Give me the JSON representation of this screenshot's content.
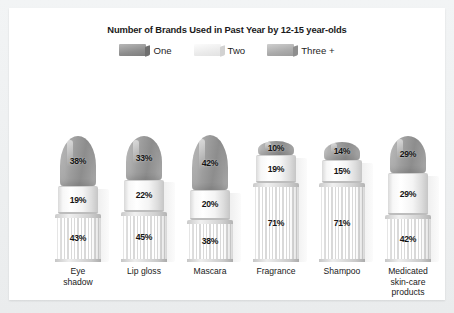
{
  "chart_data": {
    "type": "bar",
    "title": "Number of Brands Used in Past Year by 12-15 year-olds",
    "subtitle": "",
    "xlabel": "",
    "ylabel": "",
    "stacked": true,
    "units": "percent",
    "grid": false,
    "legend_position": "top",
    "legend": [
      "One",
      "Two",
      "Three +"
    ],
    "categories": [
      "Eye shadow",
      "Lip gloss",
      "Mascara",
      "Fragrance",
      "Shampoo",
      "Medicated skin-care products"
    ],
    "series": [
      {
        "name": "One",
        "values": [
          43,
          45,
          38,
          71,
          71,
          42
        ]
      },
      {
        "name": "Two",
        "values": [
          19,
          22,
          20,
          19,
          15,
          29
        ]
      },
      {
        "name": "Three +",
        "values": [
          38,
          33,
          42,
          10,
          14,
          29
        ]
      }
    ],
    "colors": {
      "one": "#8e8e8e",
      "two": "#f2f2f2",
      "three_plus": "#a9a9a9"
    }
  },
  "chart": {
    "title": "Number of Brands Used in Past Year by 12-15 year-olds",
    "legend": [
      {
        "label": "One",
        "swatch": "swatch-one"
      },
      {
        "label": "Two",
        "swatch": "swatch-two"
      },
      {
        "label": "Three +",
        "swatch": "swatch-three-plus"
      }
    ],
    "columns": [
      {
        "label_lines": [
          "Eye",
          "shadow"
        ],
        "tip_pct": "38%",
        "collar_pct": "19%",
        "barrel_pct": "43%",
        "tip_value": 38,
        "collar_value": 19,
        "barrel_value": 43
      },
      {
        "label_lines": [
          "Lip gloss"
        ],
        "tip_pct": "33%",
        "collar_pct": "22%",
        "barrel_pct": "45%",
        "tip_value": 33,
        "collar_value": 22,
        "barrel_value": 45
      },
      {
        "label_lines": [
          "Mascara"
        ],
        "tip_pct": "42%",
        "collar_pct": "20%",
        "barrel_pct": "38%",
        "tip_value": 42,
        "collar_value": 20,
        "barrel_value": 38
      },
      {
        "label_lines": [
          "Fragrance"
        ],
        "tip_pct": "10%",
        "collar_pct": "19%",
        "barrel_pct": "71%",
        "tip_value": 10,
        "collar_value": 19,
        "barrel_value": 71
      },
      {
        "label_lines": [
          "Shampoo"
        ],
        "tip_pct": "14%",
        "collar_pct": "15%",
        "barrel_pct": "71%",
        "tip_value": 14,
        "collar_value": 15,
        "barrel_value": 71
      },
      {
        "label_lines": [
          "Medicated",
          "skin-care",
          "products"
        ],
        "tip_pct": "29%",
        "collar_pct": "29%",
        "barrel_pct": "42%",
        "tip_value": 29,
        "collar_value": 29,
        "barrel_value": 42
      }
    ]
  }
}
